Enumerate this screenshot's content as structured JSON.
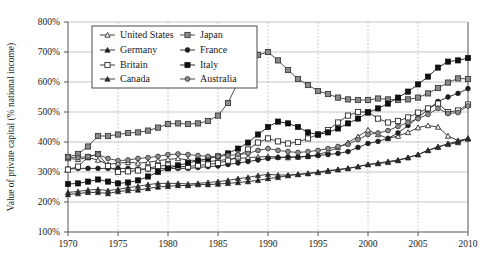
{
  "chart_data": {
    "type": "line",
    "title": "",
    "xlabel": "",
    "ylabel": "Value of private capital (% national income)",
    "xlim": [
      1970,
      2010
    ],
    "ylim": [
      100,
      800
    ],
    "ytick_step": 100,
    "xtick_step": 5,
    "grid": "horizontal-solid and vertical-dotted",
    "legend_position": "top-left inside plot",
    "ytick_labels": [
      "100%",
      "200%",
      "300%",
      "400%",
      "500%",
      "600%",
      "700%",
      "800%"
    ],
    "ytick_values": [
      100,
      200,
      300,
      400,
      500,
      600,
      700,
      800
    ],
    "xtick_labels": [
      "1970",
      "1975",
      "1980",
      "1985",
      "1990",
      "1995",
      "2000",
      "2005",
      "2010"
    ],
    "xtick_values": [
      1970,
      1975,
      1980,
      1985,
      1990,
      1995,
      2000,
      2005,
      2010
    ],
    "x": [
      1970,
      1971,
      1972,
      1973,
      1974,
      1975,
      1976,
      1977,
      1978,
      1979,
      1980,
      1981,
      1982,
      1983,
      1984,
      1985,
      1986,
      1987,
      1988,
      1989,
      1990,
      1991,
      1992,
      1993,
      1994,
      1995,
      1996,
      1997,
      1998,
      1999,
      2000,
      2001,
      2002,
      2003,
      2004,
      2005,
      2006,
      2007,
      2008,
      2009,
      2010
    ],
    "series": [
      {
        "name": "United States",
        "marker": "triangle-open",
        "color": "#2b2b2b",
        "values": [
          345,
          342,
          348,
          340,
          325,
          330,
          332,
          330,
          332,
          338,
          342,
          345,
          340,
          338,
          335,
          338,
          342,
          345,
          348,
          350,
          352,
          350,
          348,
          350,
          352,
          358,
          368,
          382,
          398,
          418,
          440,
          425,
          412,
          420,
          432,
          448,
          455,
          450,
          420,
          405,
          410
        ]
      },
      {
        "name": "Japan",
        "marker": "square-filled-grey",
        "color": "#3a3a3a",
        "values": [
          350,
          360,
          385,
          420,
          420,
          425,
          430,
          432,
          438,
          448,
          460,
          462,
          460,
          462,
          470,
          488,
          530,
          600,
          655,
          690,
          700,
          672,
          640,
          610,
          590,
          570,
          560,
          548,
          542,
          540,
          540,
          545,
          542,
          540,
          542,
          548,
          562,
          580,
          598,
          612,
          610
        ]
      },
      {
        "name": "Germany",
        "marker": "triangle-filled",
        "color": "#1f1f1f",
        "values": [
          225,
          228,
          232,
          232,
          228,
          235,
          238,
          240,
          245,
          250,
          252,
          255,
          255,
          258,
          258,
          260,
          262,
          265,
          268,
          272,
          278,
          282,
          288,
          292,
          295,
          300,
          305,
          308,
          312,
          318,
          325,
          330,
          335,
          340,
          348,
          358,
          372,
          382,
          395,
          402,
          412
        ]
      },
      {
        "name": "France",
        "marker": "circle-filled",
        "color": "#1f1f1f",
        "values": [
          310,
          312,
          312,
          312,
          312,
          312,
          312,
          310,
          310,
          312,
          312,
          312,
          312,
          315,
          318,
          320,
          325,
          330,
          335,
          340,
          345,
          348,
          350,
          350,
          352,
          355,
          358,
          362,
          368,
          382,
          395,
          402,
          412,
          430,
          455,
          482,
          508,
          535,
          550,
          562,
          578
        ]
      },
      {
        "name": "Britain",
        "marker": "square-open",
        "color": "#2b2b2b",
        "values": [
          308,
          318,
          350,
          360,
          320,
          300,
          302,
          305,
          312,
          320,
          322,
          318,
          318,
          322,
          325,
          330,
          338,
          352,
          375,
          398,
          412,
          402,
          395,
          400,
          412,
          425,
          440,
          465,
          488,
          500,
          500,
          478,
          465,
          470,
          482,
          498,
          512,
          528,
          500,
          505,
          525
        ]
      },
      {
        "name": "Italy",
        "marker": "square-filled-black",
        "color": "#111111",
        "values": [
          260,
          262,
          268,
          275,
          268,
          262,
          265,
          272,
          285,
          300,
          312,
          322,
          330,
          338,
          345,
          352,
          362,
          378,
          398,
          425,
          450,
          468,
          462,
          450,
          432,
          425,
          432,
          445,
          462,
          478,
          498,
          512,
          528,
          548,
          568,
          592,
          618,
          648,
          668,
          672,
          680
        ]
      },
      {
        "name": "Canada",
        "marker": "triangle-filled-small",
        "color": "#2b2b2b",
        "values": [
          232,
          235,
          240,
          242,
          238,
          242,
          248,
          252,
          258,
          262,
          262,
          262,
          260,
          262,
          265,
          268,
          272,
          278,
          282,
          288,
          292,
          290,
          290,
          292,
          295,
          298,
          302,
          308,
          312,
          318,
          325,
          328,
          332,
          338,
          348,
          358,
          372,
          385,
          392,
          398,
          412
        ]
      },
      {
        "name": "Australia",
        "marker": "circle-filled-grey",
        "color": "#3d3d3d",
        "values": [
          350,
          348,
          352,
          358,
          345,
          338,
          340,
          345,
          348,
          352,
          358,
          360,
          358,
          355,
          352,
          352,
          355,
          358,
          362,
          372,
          378,
          372,
          368,
          365,
          368,
          372,
          378,
          385,
          392,
          408,
          425,
          430,
          438,
          452,
          465,
          478,
          492,
          512,
          495,
          498,
          520
        ]
      }
    ]
  },
  "legend": {
    "entries": [
      {
        "label": "United States",
        "marker": "triangle-open"
      },
      {
        "label": "Japan",
        "marker": "square-filled-grey"
      },
      {
        "label": "Germany",
        "marker": "triangle-filled"
      },
      {
        "label": "France",
        "marker": "circle-filled"
      },
      {
        "label": "Britain",
        "marker": "square-open"
      },
      {
        "label": "Italy",
        "marker": "square-filled-black"
      },
      {
        "label": "Canada",
        "marker": "triangle-filled-small"
      },
      {
        "label": "Australia",
        "marker": "circle-filled-grey"
      }
    ]
  },
  "colors": {
    "background": "#ffffff",
    "frame": "#555555",
    "grid_horizontal": "#b9b9b9",
    "grid_vertical": "#b0b0b0",
    "text": "#1a1a1a"
  }
}
